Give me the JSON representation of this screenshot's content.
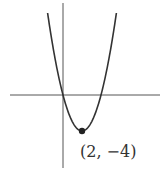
{
  "chart_data": {
    "type": "line",
    "title": "",
    "xlabel": "",
    "ylabel": "",
    "function": "y = (x - 2)^2 - 4",
    "vertex": {
      "x": 2,
      "y": -4
    },
    "x_intercepts": [
      0,
      4
    ],
    "annotations": [
      {
        "text": "(2, −4)",
        "x": 2,
        "y": -4
      }
    ],
    "xlim": [
      -2.5,
      5.2
    ],
    "ylim": [
      -4.8,
      4.2
    ],
    "grid": false,
    "legend": "none"
  }
}
